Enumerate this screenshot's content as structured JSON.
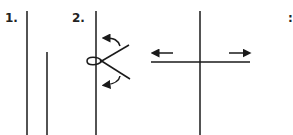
{
  "diagram": {
    "type": "knot-tying-instructions",
    "stroke_color": "#1a1a1a",
    "background": "#ffffff",
    "steps": [
      {
        "number": "1.",
        "description": "Two vertical lines side by side; the left line is long, the right line starts lower"
      },
      {
        "number": "2.",
        "description": "A loop formed around a vertical line with two strands crossing, curved arrows indicating twisting direction"
      },
      {
        "number": "",
        "description": "Vertical line crossed by a horizontal line, arrows pointing left and right indicating pulling apart"
      },
      {
        "number": "3.",
        "description": "Step label partially visible at right edge"
      }
    ]
  },
  "labels": {
    "step1": "1.",
    "step2": "2.",
    "step3": ":"
  }
}
